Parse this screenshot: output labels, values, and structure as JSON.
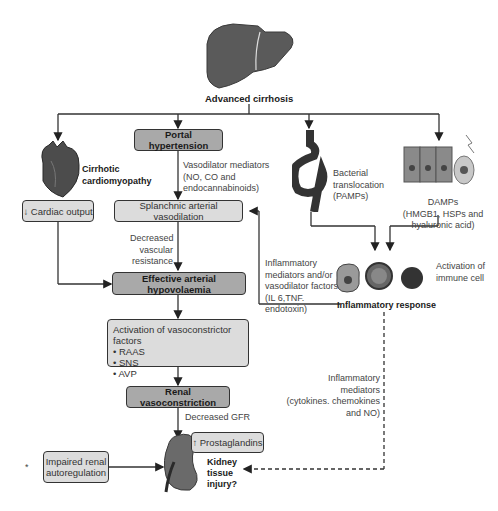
{
  "title": "Advanced cirrhosis",
  "nodes": {
    "advanced_cirrhosis": "Advanced cirrhosis",
    "portal_hypertension": "Portal hypertension",
    "cirrhotic_cardiomyopathy_line1": "Cirrhotic",
    "cirrhotic_cardiomyopathy_line2": "cardiomyopathy",
    "cardiac_output": "↓ Cardiac output",
    "splanchnic_vasodilation": "Splanchnic arterial vasodilation",
    "effective_hypovolaemia": "Effective arterial hypovolaemia",
    "vasoconstrictor_title": "Activation of vasoconstrictor factors",
    "vasoconstrictor_items": [
      "• RAAS",
      "• SNS",
      "• AVP"
    ],
    "renal_vasoconstriction": "Renal vasoconstriction",
    "prostaglandins": "↑ Prostaglandins",
    "impaired_autoregulation_line1": "Impaired renal",
    "impaired_autoregulation_line2": "autoregulation",
    "kidney_injury_line1": "Kidney",
    "kidney_injury_line2": "tissue",
    "kidney_injury_line3": "injury?",
    "inflammatory_response": "Inflammatory response",
    "activation_immune_line1": "Activation of",
    "activation_immune_line2": "immune cell"
  },
  "labels": {
    "vasodilator_mediators": [
      "Vasodilator mediators",
      "(NO, CO and",
      "endocannabinoids)"
    ],
    "decreased_resistance": [
      "Decreased",
      "vascular",
      "resistance"
    ],
    "bacterial_translocation": [
      "Bacterial",
      "translocation",
      "(PAMPs)"
    ],
    "damps": [
      "DAMPs",
      "(HMGB1, HSPs and",
      "hyaluronic acid)"
    ],
    "inflammatory_mediators_vasodilator": [
      "Inflammatory",
      "mediators and/or",
      "vasodilator factors",
      "(IL 6,TNF.",
      "endotoxin)"
    ],
    "inflammatory_mediators_cytokines": [
      "Inflammatory mediators",
      "(cytokines. chemokines",
      "and NO)"
    ],
    "decreased_gfr": "Decreased GFR",
    "asterisk": "*"
  },
  "icons": [
    "liver-icon",
    "heart-icon",
    "intestine-icon",
    "epithelial-cells-icon",
    "immune-cells-icon",
    "kidney-icon"
  ],
  "colors": {
    "dark_box": "#a9a9a9",
    "light_box": "#dcdcdc",
    "line": "#333333"
  }
}
